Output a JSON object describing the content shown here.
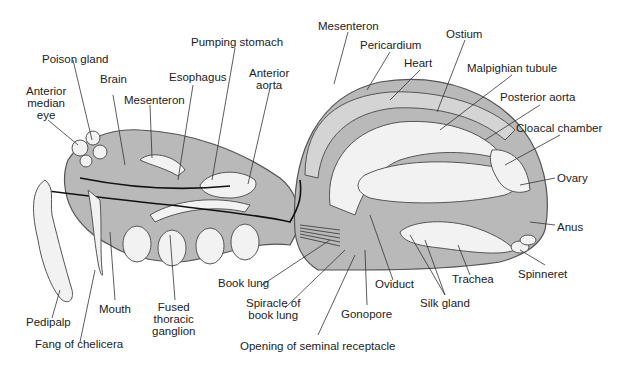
{
  "diagram": {
    "labels": {
      "poison_gland": "Poison gland",
      "anterior_median_eye": "Anterior\nmedian\neye",
      "brain": "Brain",
      "mesenteron_front": "Mesenteron",
      "esophagus": "Esophagus",
      "pumping_stomach": "Pumping stomach",
      "anterior_aorta": "Anterior\naorta",
      "mesenteron_top": "Mesenteron",
      "pericardium": "Pericardium",
      "heart": "Heart",
      "ostium": "Ostium",
      "malpighian_tubule": "Malpighian tubule",
      "posterior_aorta": "Posterior aorta",
      "cloacal_chamber": "Cloacal chamber",
      "ovary": "Ovary",
      "anus": "Anus",
      "spinneret": "Spinneret",
      "trachea": "Trachea",
      "silk_gland": "Silk gland",
      "oviduct": "Oviduct",
      "gonopore": "Gonopore",
      "opening_seminal_receptacle": "Opening of seminal receptacle",
      "spiracle_book_lung": "Spiracle of\nbook lung",
      "book_lung": "Book lung",
      "fused_thoracic_ganglion": "Fused\nthoracic\nganglion",
      "mouth": "Mouth",
      "pedipalp": "Pedipalp",
      "fang_of_chelicera": "Fang of chelicera"
    },
    "colors": {
      "body_fill": "#b9b9b9",
      "organ_fill": "#f2f2f2",
      "outline": "#555555",
      "text": "#222222"
    }
  }
}
